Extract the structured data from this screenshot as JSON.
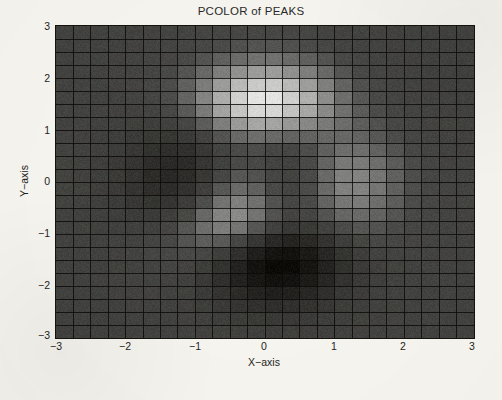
{
  "figure": {
    "title": "PCOLOR of PEAKS",
    "background_color": "#f7f6f0",
    "frame_color": "#15140f",
    "width": 502,
    "height": 400
  },
  "axes": {
    "x_label": "X−axis",
    "y_label": "Y−axis",
    "x_ticks": [
      "−3",
      "−2",
      "−1",
      "0",
      "1",
      "2",
      "3"
    ],
    "y_ticks": [
      "3",
      "2",
      "1",
      "0",
      "−1",
      "−2",
      "−3"
    ]
  },
  "chart_data": {
    "type": "heatmap",
    "title": "PCOLOR of PEAKS",
    "xlabel": "X−axis",
    "ylabel": "Y−axis",
    "xlim": [
      -3,
      3
    ],
    "ylim": [
      -3,
      3
    ],
    "xtick_values": [
      -3,
      -2,
      -1,
      0,
      1,
      2,
      3
    ],
    "ytick_values": [
      -3,
      -2,
      -1,
      0,
      1,
      2,
      3
    ],
    "xtick_labels": [
      "−3",
      "−2",
      "−1",
      "0",
      "1",
      "2",
      "3"
    ],
    "ytick_labels": [
      "3",
      "2",
      "1",
      "0",
      "−1",
      "−2",
      "−3"
    ],
    "grid": true,
    "grid_color": "#15140f",
    "legend": "none",
    "colorbar": false,
    "colormap": "gray",
    "colormap_stops": [
      "#0d0b08",
      "#4a4a48",
      "#e9e9e7"
    ],
    "nx": 24,
    "ny": 24,
    "cell_width_px": 17.42,
    "cell_height_px": 13.0,
    "zlim": [
      -6.5,
      8.1
    ],
    "function": "peaks",
    "function_expression": "3*(1-x)^2*exp(-x^2-(y+1)^2) - 10*(x/5 - x^3 - y^5)*exp(-x^2-y^2) - (1/3)*exp(-(x+1)^2 - y^2)",
    "features": [
      {
        "name": "global-maximum",
        "x": 0.25,
        "y": 1.6,
        "value": 8.1,
        "shade": "#e9e9e7"
      },
      {
        "name": "global-minimum",
        "x": 0.3,
        "y": -1.6,
        "value": -6.5,
        "shade": "#0d0b08"
      },
      {
        "name": "secondary-minimum",
        "x": -1.2,
        "y": 0.3,
        "value": -3.1,
        "shade": "#262420"
      },
      {
        "name": "secondary-maximum",
        "x": -0.5,
        "y": -0.2,
        "value": 3.2,
        "shade": "#8e8e8b"
      },
      {
        "name": "background-field",
        "x": 2.3,
        "y": 0.2,
        "value": 0.0,
        "shade": "#4a4a48"
      }
    ]
  }
}
